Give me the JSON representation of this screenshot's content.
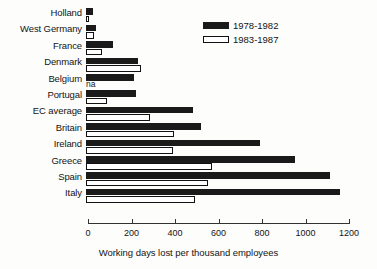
{
  "chart_data": {
    "type": "bar",
    "orientation": "horizontal",
    "title": "",
    "xlabel": "Working days lost per thousand employees",
    "ylabel": "",
    "xlim": [
      0,
      1200
    ],
    "xticks": [
      0,
      200,
      400,
      600,
      800,
      1000,
      1200
    ],
    "grid": false,
    "legend_position": "top-right",
    "categories": [
      "Holland",
      "West Germany",
      "France",
      "Denmark",
      "Belgium",
      "Portugal",
      "EC average",
      "Britain",
      "Ireland",
      "Greece",
      "Spain",
      "Italy"
    ],
    "series": [
      {
        "name": "1978-1982",
        "color": "#1a1a1a",
        "values": [
          30,
          45,
          125,
          240,
          220,
          230,
          490,
          530,
          800,
          960,
          1120,
          1170
        ]
      },
      {
        "name": "1983-1987",
        "color": "#ffffff",
        "values": [
          15,
          37,
          75,
          255,
          null,
          95,
          295,
          405,
          400,
          580,
          560,
          500
        ],
        "missing_label": "na"
      }
    ]
  },
  "legend": {
    "items": [
      {
        "label": "1978-1982",
        "style": "dark"
      },
      {
        "label": "1983-1987",
        "style": "light"
      }
    ]
  },
  "axis": {
    "title": "Working days lost per thousand employees",
    "ticks": [
      "0",
      "200",
      "400",
      "600",
      "800",
      "1000",
      "1200"
    ]
  },
  "colors": {
    "bar_dark": "#1a1a1a",
    "bar_light": "#ffffff",
    "outline": "#111111",
    "axis": "#333333",
    "background": "#fdfdfc",
    "text": "#141414"
  }
}
